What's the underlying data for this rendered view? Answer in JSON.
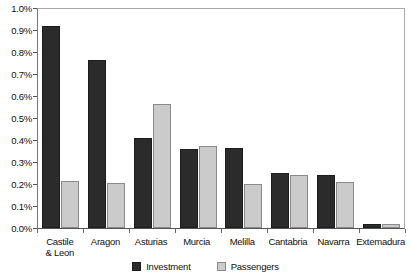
{
  "chart_data": {
    "type": "bar",
    "title": "",
    "subtitle": "",
    "xlabel": "",
    "ylabel": "",
    "ylim": [
      0,
      1.0
    ],
    "ytick_labels": [
      "1.0%",
      "0.9%",
      "0.8%",
      "0.7%",
      "0.6%",
      "0.5%",
      "0.4%",
      "0.3%",
      "0.2%",
      "0.1%",
      "0.0%"
    ],
    "ytick_values": [
      1.0,
      0.9,
      0.8,
      0.7,
      0.6,
      0.5,
      0.4,
      0.3,
      0.2,
      0.1,
      0.0
    ],
    "grid": false,
    "legend_position": "bottom",
    "categories": [
      "Castile\n& Leon",
      "Aragon",
      "Asturias",
      "Murcia",
      "Melilla",
      "Cantabria",
      "Navarra",
      "Extemadura"
    ],
    "category_lines": [
      [
        "Castile",
        "& Leon"
      ],
      [
        "Aragon"
      ],
      [
        "Asturias"
      ],
      [
        "Murcia"
      ],
      [
        "Melilla"
      ],
      [
        "Cantabria"
      ],
      [
        "Navarra"
      ],
      [
        "Extemadura"
      ]
    ],
    "series": [
      {
        "name": "Investment",
        "color": "#2b2b2b",
        "values": [
          0.92,
          0.765,
          0.41,
          0.36,
          0.365,
          0.25,
          0.24,
          0.02
        ]
      },
      {
        "name": "Passengers",
        "color": "#cbcbcb",
        "values": [
          0.215,
          0.205,
          0.565,
          0.375,
          0.2,
          0.24,
          0.21,
          0.02
        ]
      }
    ]
  },
  "legend": {
    "items": [
      {
        "label": "Investment",
        "color": "#2b2b2b"
      },
      {
        "label": "Passengers",
        "color": "#cbcbcb"
      }
    ]
  }
}
